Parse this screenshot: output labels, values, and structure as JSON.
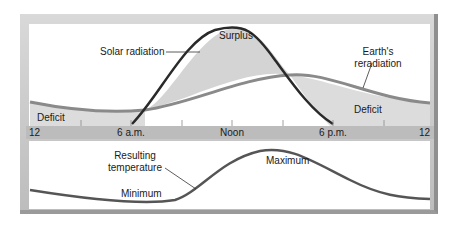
{
  "diagram": {
    "top_panel": {
      "labels": {
        "solar_radiation": "Solar radiation",
        "surplus": "Surplus",
        "earths_reradiation_line1": "Earth's",
        "earths_reradiation_line2": "reradiation",
        "deficit_left": "Deficit",
        "deficit_right": "Deficit"
      }
    },
    "time_axis": {
      "ticks": [
        "12",
        "6 a.m.",
        "Noon",
        "6 p.m.",
        "12"
      ]
    },
    "bottom_panel": {
      "labels": {
        "resulting_temperature_line1": "Resulting",
        "resulting_temperature_line2": "temperature",
        "minimum": "Minimum",
        "maximum": "Maximum"
      }
    },
    "colors": {
      "frame": "#c8c8c8",
      "solar_curve": "#2a2a2a",
      "earth_curve": "#8a8a8a",
      "fill": "#d4d4d4",
      "temperature_curve": "#555555"
    }
  }
}
